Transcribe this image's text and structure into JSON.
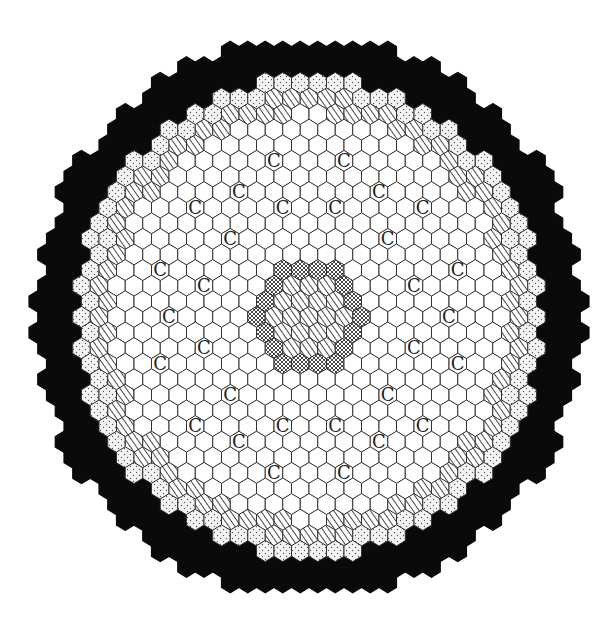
{
  "diagram": {
    "type": "hexagonal-core-map",
    "orientation": "pointy-top",
    "center": {
      "x": 309,
      "y": 317
    },
    "hex_width": 17.5,
    "row_spacing": 15.6,
    "rows": 17,
    "regions": [
      {
        "name": "central-striped",
        "pattern": "diagonal-stripes",
        "hex_distance_max": 2
      },
      {
        "name": "central-crosshatch",
        "pattern": "crosshatch",
        "hex_distance_max": 3
      },
      {
        "name": "inner-white",
        "pattern": "blank",
        "radius_max": 198
      },
      {
        "name": "striped-ring",
        "pattern": "diagonal-stripes",
        "radius_max": 215
      },
      {
        "name": "dotted-ring",
        "pattern": "dots",
        "radius_max": 235
      },
      {
        "name": "outer-black-ring",
        "pattern": "solid-black",
        "radius_max": 274
      }
    ],
    "marker_label": "C",
    "markers": [
      [
        -4,
        -10
      ],
      [
        4,
        -10
      ],
      [
        -8,
        -8
      ],
      [
        8,
        -8
      ],
      [
        -13,
        -7
      ],
      [
        -3,
        -7
      ],
      [
        3,
        -7
      ],
      [
        13,
        -7
      ],
      [
        -9,
        -5
      ],
      [
        9,
        -5
      ],
      [
        -17,
        -3
      ],
      [
        17,
        -3
      ],
      [
        -12,
        -2
      ],
      [
        12,
        -2
      ],
      [
        -16,
        0
      ],
      [
        16,
        0
      ],
      [
        -12,
        2
      ],
      [
        12,
        2
      ],
      [
        -17,
        3
      ],
      [
        17,
        3
      ],
      [
        -9,
        5
      ],
      [
        9,
        5
      ],
      [
        -13,
        7
      ],
      [
        -3,
        7
      ],
      [
        3,
        7
      ],
      [
        13,
        7
      ],
      [
        -8,
        8
      ],
      [
        8,
        8
      ],
      [
        -4,
        10
      ],
      [
        4,
        10
      ]
    ],
    "colors": {
      "stroke": "#333333",
      "black": "#0a0a0a",
      "fill": "#ffffff",
      "dot": "#555555"
    }
  }
}
